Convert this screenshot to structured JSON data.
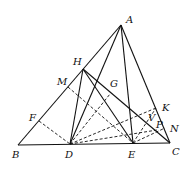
{
  "diagram": {
    "type": "geometry-figure",
    "points": {
      "A": {
        "x": 121,
        "y": 25,
        "lx": 126,
        "ly": 23
      },
      "H": {
        "x": 83,
        "y": 69,
        "lx": 73,
        "ly": 65
      },
      "M": {
        "x": 68,
        "y": 87,
        "lx": 57,
        "ly": 85
      },
      "G": {
        "x": 110,
        "y": 94,
        "lx": 110,
        "ly": 87
      },
      "F": {
        "x": 39,
        "y": 121,
        "lx": 29,
        "ly": 121
      },
      "B": {
        "x": 18,
        "y": 145,
        "lx": 12,
        "ly": 158
      },
      "D": {
        "x": 70,
        "y": 144,
        "lx": 65,
        "ly": 158
      },
      "E": {
        "x": 133,
        "y": 143,
        "lx": 128,
        "ly": 158
      },
      "C": {
        "x": 170,
        "y": 143,
        "lx": 172,
        "ly": 155
      },
      "K": {
        "x": 156,
        "y": 108,
        "lx": 162,
        "ly": 111
      },
      "V": {
        "x": 152,
        "y": 121,
        "lx": 148,
        "ly": 121
      },
      "P": {
        "x": 157,
        "y": 130,
        "lx": 156,
        "ly": 128
      },
      "N": {
        "x": 165,
        "y": 128,
        "lx": 170,
        "ly": 132
      }
    },
    "labels": [
      "A",
      "H",
      "M",
      "G",
      "F",
      "B",
      "D",
      "E",
      "C",
      "K",
      "V",
      "P",
      "N"
    ],
    "solid_segments": [
      [
        "B",
        "C"
      ],
      [
        "B",
        "A"
      ],
      [
        "A",
        "C"
      ],
      [
        "A",
        "D"
      ],
      [
        "A",
        "E"
      ],
      [
        "H",
        "D"
      ],
      [
        "H",
        "E"
      ],
      [
        "H",
        "C"
      ]
    ],
    "dashed_segments": [
      [
        "F",
        "D"
      ],
      [
        "M",
        "E"
      ],
      [
        "D",
        "G"
      ],
      [
        "D",
        "K"
      ],
      [
        "E",
        "K"
      ],
      [
        "D",
        "P"
      ],
      [
        "E",
        "N"
      ]
    ]
  }
}
